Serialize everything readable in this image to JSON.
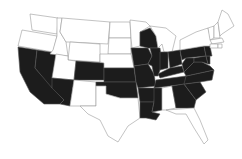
{
  "map": {
    "title": "",
    "type": "choropleth",
    "region": "United States (contiguous)",
    "colors": {
      "highlighted": "#1c1c1c",
      "not_highlighted": "#ffffff",
      "border": "#9a9a9a"
    },
    "highlighted_states": [
      "CA",
      "NV",
      "AZ",
      "CO",
      "KS",
      "OK",
      "MO",
      "AR",
      "LA",
      "MS",
      "IA",
      "WI",
      "IL",
      "IN",
      "OH",
      "KY",
      "TN",
      "PA",
      "WV",
      "VA",
      "NC",
      "SC",
      "GA",
      "MD",
      "DE",
      "NJ"
    ],
    "states": [
      {
        "id": "WA",
        "on": false,
        "points": "30,14 58,18 57,34 32,30"
      },
      {
        "id": "OR",
        "on": false,
        "points": "22,30 57,36 53,52 18,46"
      },
      {
        "id": "CA",
        "on": true,
        "points": "18,47 37,50 35,68 64,100 60,104 44,104 30,92 20,72"
      },
      {
        "id": "NV",
        "on": true,
        "points": "37,50 56,53 52,88 35,68"
      },
      {
        "id": "ID",
        "on": false,
        "points": "57,18 62,18 60,32 66,42 68,56 50,54 53,50 57,36"
      },
      {
        "id": "MT",
        "on": false,
        "points": "62,18 110,22 108,44 70,42 66,42 60,32"
      },
      {
        "id": "WY",
        "on": false,
        "points": "70,42 100,44 100,62 68,60"
      },
      {
        "id": "UT",
        "on": false,
        "points": "56,54 68,56 68,60 76,61 74,80 52,78"
      },
      {
        "id": "AZ",
        "on": true,
        "points": "52,78 74,80 70,106 60,104 64,100 52,88"
      },
      {
        "id": "CO",
        "on": true,
        "points": "76,61 104,63 104,80 74,80"
      },
      {
        "id": "NM",
        "on": false,
        "points": "74,80 96,82 96,106 74,106 70,106"
      },
      {
        "id": "ND",
        "on": false,
        "points": "110,22 130,22 131,38 109,38"
      },
      {
        "id": "SD",
        "on": false,
        "points": "109,38 131,38 131,54 108,54"
      },
      {
        "id": "NE",
        "on": false,
        "points": "100,54 131,54 134,68 104,68 104,63 100,62"
      },
      {
        "id": "KS",
        "on": true,
        "points": "104,68 134,68 136,82 104,82"
      },
      {
        "id": "OK",
        "on": true,
        "points": "96,82 136,82 138,98 120,98 106,94 106,86 96,86"
      },
      {
        "id": "TX",
        "on": false,
        "points": "96,86 106,86 106,94 120,98 138,98 140,118 128,126 118,142 108,136 100,120 88,114 80,106 96,106"
      },
      {
        "id": "MN",
        "on": false,
        "points": "130,20 146,22 150,26 140,32 140,46 132,48 131,38"
      },
      {
        "id": "IA",
        "on": true,
        "points": "131,48 148,48 152,56 148,64 134,66"
      },
      {
        "id": "MO",
        "on": true,
        "points": "134,66 148,64 154,74 156,86 138,88 136,82"
      },
      {
        "id": "AR",
        "on": true,
        "points": "138,88 156,88 154,102 140,102"
      },
      {
        "id": "LA",
        "on": true,
        "points": "140,102 154,102 152,112 160,114 156,120 146,118 140,118"
      },
      {
        "id": "WI",
        "on": true,
        "points": "140,32 150,28 156,36 158,48 148,48 140,46"
      },
      {
        "id": "IL",
        "on": true,
        "points": "150,48 160,48 162,64 158,76 154,76 152,66 148,64 152,56"
      },
      {
        "id": "MI",
        "on": false,
        "points": "150,26 166,28 176,36 172,52 164,52 162,44 158,48 156,36"
      },
      {
        "id": "IN",
        "on": true,
        "points": "160,52 168,52 168,68 160,70"
      },
      {
        "id": "OH",
        "on": true,
        "points": "168,52 180,50 182,64 170,68"
      },
      {
        "id": "KY",
        "on": true,
        "points": "158,74 170,68 182,66 184,72 160,78"
      },
      {
        "id": "TN",
        "on": true,
        "points": "156,80 186,76 186,84 154,88"
      },
      {
        "id": "MS",
        "on": true,
        "points": "154,88 162,88 162,110 152,112 154,102"
      },
      {
        "id": "AL",
        "on": false,
        "points": "162,88 172,86 176,108 166,110 162,110"
      },
      {
        "id": "GA",
        "on": true,
        "points": "172,86 184,84 196,100 194,108 176,108"
      },
      {
        "id": "FL",
        "on": false,
        "points": "166,110 194,108 200,120 208,140 204,144 194,128 186,114 176,114"
      },
      {
        "id": "SC",
        "on": true,
        "points": "184,84 200,82 206,92 196,100"
      },
      {
        "id": "NC",
        "on": true,
        "points": "186,76 214,70 212,80 200,82 184,84"
      },
      {
        "id": "VA",
        "on": true,
        "points": "184,72 194,62 202,62 210,66 214,70 186,76"
      },
      {
        "id": "WV",
        "on": true,
        "points": "182,64 186,58 194,58 194,62 184,72"
      },
      {
        "id": "PA",
        "on": true,
        "points": "180,50 204,46 206,56 186,58 182,60"
      },
      {
        "id": "MD",
        "on": true,
        "points": "194,58 206,56 208,64 202,62 194,62"
      },
      {
        "id": "DE",
        "on": true,
        "points": "206,56 210,56 210,64 208,64"
      },
      {
        "id": "NJ",
        "on": true,
        "points": "204,46 210,46 212,56 206,56"
      },
      {
        "id": "NY",
        "on": false,
        "points": "180,40 196,32 208,28 212,44 210,46 204,46 180,50"
      },
      {
        "id": "VT",
        "on": false,
        "points": "208,28 214,26 214,38 210,40"
      },
      {
        "id": "NH",
        "on": false,
        "points": "214,26 218,22 220,38 214,38"
      },
      {
        "id": "ME",
        "on": false,
        "points": "218,22 222,10 228,14 234,26 222,34 220,36"
      },
      {
        "id": "MA",
        "on": false,
        "points": "210,40 222,38 224,42 212,44"
      },
      {
        "id": "CT",
        "on": false,
        "points": "210,44 218,44 218,48 210,48"
      },
      {
        "id": "RI",
        "on": false,
        "points": "218,44 222,44 222,48 218,48"
      }
    ]
  }
}
